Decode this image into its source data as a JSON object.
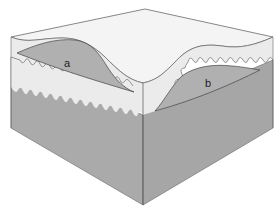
{
  "diagram": {
    "type": "block-diagram-3d",
    "labels": {
      "a": "a",
      "b": "b"
    },
    "colors": {
      "background": "#ffffff",
      "top_surface": "#f2f2f2",
      "upper_layer": "#ececec",
      "lower_block": "#a9a9a9",
      "lower_block_right": "#a6a6a6",
      "lens": "#b3b3b3",
      "outline": "#555555"
    }
  }
}
